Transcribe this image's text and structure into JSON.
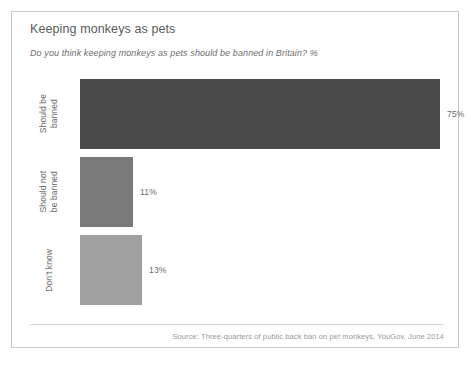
{
  "card": {
    "title": "Keeping monkeys as pets",
    "subtitle": "Do you think keeping monkeys as pets should be banned in Britain? %",
    "source": "Source: Three-quarters of public back ban on pet monkeys, YouGov, June 2014",
    "border_color": "#c9c9c9",
    "background": "#ffffff"
  },
  "chart_data": {
    "type": "bar",
    "orientation": "horizontal",
    "title": "Keeping monkeys as pets",
    "subtitle": "Do you think keeping monkeys as pets should be banned in Britain? %",
    "categories": [
      "Should be banned",
      "Should not be banned",
      "Don't know"
    ],
    "category_lines": [
      [
        "Should be",
        "banned"
      ],
      [
        "Should not",
        "be banned"
      ],
      [
        "Don't know"
      ]
    ],
    "values": [
      75,
      11,
      13
    ],
    "value_labels": [
      "75%",
      "11%",
      "13%"
    ],
    "colors": [
      "#4a4a4a",
      "#7a7a7a",
      "#a0a0a0"
    ],
    "xlabel": "",
    "ylabel": "",
    "xlim": [
      0,
      75
    ],
    "grid": false,
    "legend": false,
    "units": "%",
    "source": "Source: Three-quarters of public back ban on pet monkeys, YouGov, June 2014"
  }
}
